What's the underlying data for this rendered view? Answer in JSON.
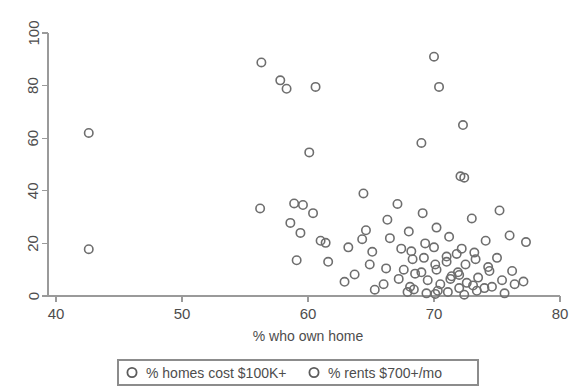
{
  "chart_data": {
    "type": "scatter",
    "title": "",
    "xlabel": "% who own home",
    "ylabel": "",
    "xlim": [
      40,
      80
    ],
    "ylim": [
      0,
      100
    ],
    "xticks": [
      40,
      50,
      60,
      70,
      80
    ],
    "yticks": [
      0,
      20,
      40,
      60,
      80,
      100
    ],
    "grid": false,
    "legend_position": "bottom",
    "marker": "open-circle",
    "marker_color": "#6e6e6e",
    "series": [
      {
        "name": "% homes cost $100K+",
        "points": [
          [
            42.6,
            62.0
          ],
          [
            42.6,
            17.8
          ],
          [
            56.3,
            88.8
          ],
          [
            56.2,
            33.3
          ],
          [
            58.3,
            78.8
          ],
          [
            58.9,
            35.2
          ],
          [
            58.6,
            27.8
          ],
          [
            59.4,
            24.0
          ],
          [
            59.1,
            13.6
          ],
          [
            60.1,
            54.6
          ],
          [
            60.4,
            31.5
          ],
          [
            61.4,
            20.2
          ],
          [
            61.6,
            13.0
          ],
          [
            62.9,
            5.4
          ],
          [
            63.7,
            8.2
          ],
          [
            64.4,
            39.0
          ],
          [
            64.6,
            25.0
          ],
          [
            64.3,
            21.6
          ],
          [
            65.1,
            16.8
          ],
          [
            65.3,
            2.4
          ],
          [
            66.3,
            29.0
          ],
          [
            66.5,
            22.0
          ],
          [
            66.2,
            10.5
          ],
          [
            67.1,
            35.0
          ],
          [
            67.4,
            18.0
          ],
          [
            67.2,
            6.5
          ],
          [
            68.0,
            24.5
          ],
          [
            68.3,
            14.0
          ],
          [
            68.1,
            3.5
          ],
          [
            69.0,
            58.2
          ],
          [
            69.1,
            31.5
          ],
          [
            69.3,
            20.0
          ],
          [
            69.0,
            9.0
          ],
          [
            70.0,
            91.0
          ],
          [
            70.4,
            79.5
          ],
          [
            70.2,
            26.0
          ],
          [
            70.1,
            12.0
          ],
          [
            70.3,
            2.0
          ],
          [
            71.2,
            22.5
          ],
          [
            71.0,
            15.0
          ],
          [
            71.4,
            7.5
          ],
          [
            72.3,
            65.0
          ],
          [
            72.1,
            45.5
          ],
          [
            72.4,
            45.0
          ],
          [
            72.2,
            18.0
          ],
          [
            72.0,
            8.0
          ],
          [
            73.0,
            29.5
          ],
          [
            73.2,
            16.5
          ],
          [
            73.1,
            4.0
          ],
          [
            74.1,
            21.0
          ],
          [
            74.3,
            11.0
          ],
          [
            74.0,
            3.0
          ],
          [
            75.2,
            32.5
          ],
          [
            75.0,
            14.5
          ],
          [
            76.0,
            23.0
          ],
          [
            76.2,
            9.5
          ],
          [
            77.3,
            20.5
          ],
          [
            77.1,
            5.5
          ]
        ]
      },
      {
        "name": "% rents $700+/mo",
        "points": [
          [
            57.8,
            82.0
          ],
          [
            59.6,
            34.6
          ],
          [
            60.6,
            79.5
          ],
          [
            61.0,
            21.0
          ],
          [
            63.2,
            18.5
          ],
          [
            64.9,
            12.0
          ],
          [
            66.0,
            4.5
          ],
          [
            67.6,
            10.0
          ],
          [
            67.9,
            1.5
          ],
          [
            68.2,
            17.0
          ],
          [
            68.5,
            8.5
          ],
          [
            68.4,
            2.5
          ],
          [
            69.2,
            14.5
          ],
          [
            69.5,
            6.0
          ],
          [
            69.4,
            1.0
          ],
          [
            70.0,
            18.5
          ],
          [
            70.2,
            10.0
          ],
          [
            70.5,
            4.5
          ],
          [
            70.1,
            0.8
          ],
          [
            71.0,
            13.0
          ],
          [
            71.3,
            6.5
          ],
          [
            71.1,
            1.5
          ],
          [
            71.8,
            16.0
          ],
          [
            71.9,
            9.0
          ],
          [
            72.0,
            3.0
          ],
          [
            72.5,
            12.0
          ],
          [
            72.6,
            5.0
          ],
          [
            72.4,
            0.5
          ],
          [
            73.3,
            14.0
          ],
          [
            73.5,
            7.0
          ],
          [
            73.4,
            2.0
          ],
          [
            74.4,
            9.5
          ],
          [
            74.6,
            3.5
          ],
          [
            75.4,
            6.0
          ],
          [
            75.6,
            1.0
          ],
          [
            76.4,
            4.5
          ]
        ]
      }
    ]
  },
  "axes": {
    "x_title": "% who own home",
    "x_tick_labels": [
      "40",
      "50",
      "60",
      "70",
      "80"
    ],
    "y_tick_labels": [
      "0",
      "20",
      "40",
      "60",
      "80",
      "100"
    ]
  },
  "legend": {
    "entries": [
      {
        "label": "% homes cost $100K+",
        "marker": "open-circle"
      },
      {
        "label": "% rents $700+/mo",
        "marker": "open-circle"
      }
    ]
  }
}
